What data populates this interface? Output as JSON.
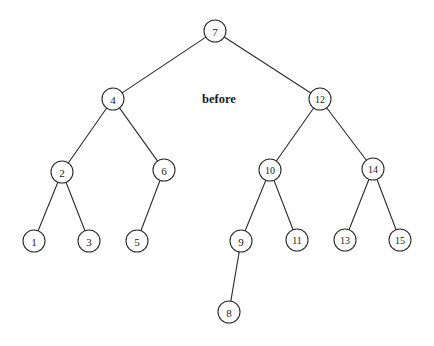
{
  "figure": {
    "caption": "before",
    "caption_x": 219,
    "caption_y": 99,
    "width": 434,
    "height": 346,
    "background_color": "#ffffff",
    "stroke_color": "#2b2b2b",
    "text_color": "#1a1a1a"
  },
  "chart_data": {
    "type": "diagram",
    "diagram_kind": "binary-search-tree",
    "title": "before",
    "node_radius": 11,
    "nodes": [
      {
        "id": "n7",
        "label": "7",
        "x": 215,
        "y": 31,
        "depth": 0
      },
      {
        "id": "n4",
        "label": "4",
        "x": 113,
        "y": 99,
        "depth": 1
      },
      {
        "id": "n12",
        "label": "12",
        "x": 320,
        "y": 99,
        "depth": 1
      },
      {
        "id": "n2",
        "label": "2",
        "x": 62,
        "y": 172,
        "depth": 2
      },
      {
        "id": "n6",
        "label": "6",
        "x": 164,
        "y": 170,
        "depth": 2
      },
      {
        "id": "n10",
        "label": "10",
        "x": 270,
        "y": 170,
        "depth": 2
      },
      {
        "id": "n14",
        "label": "14",
        "x": 373,
        "y": 169,
        "depth": 2
      },
      {
        "id": "n1",
        "label": "1",
        "x": 34,
        "y": 241,
        "depth": 3
      },
      {
        "id": "n3",
        "label": "3",
        "x": 89,
        "y": 241,
        "depth": 3
      },
      {
        "id": "n5",
        "label": "5",
        "x": 137,
        "y": 241,
        "depth": 3
      },
      {
        "id": "n9",
        "label": "9",
        "x": 241,
        "y": 241,
        "depth": 3
      },
      {
        "id": "n11",
        "label": "11",
        "x": 297,
        "y": 240,
        "depth": 3
      },
      {
        "id": "n13",
        "label": "13",
        "x": 345,
        "y": 240,
        "depth": 3
      },
      {
        "id": "n15",
        "label": "15",
        "x": 400,
        "y": 240,
        "depth": 3
      },
      {
        "id": "n8",
        "label": "8",
        "x": 229,
        "y": 312,
        "depth": 4
      }
    ],
    "edges": [
      {
        "from": "n7",
        "to": "n4",
        "side": "left"
      },
      {
        "from": "n7",
        "to": "n12",
        "side": "right"
      },
      {
        "from": "n4",
        "to": "n2",
        "side": "left"
      },
      {
        "from": "n4",
        "to": "n6",
        "side": "right"
      },
      {
        "from": "n12",
        "to": "n10",
        "side": "left"
      },
      {
        "from": "n12",
        "to": "n14",
        "side": "right"
      },
      {
        "from": "n2",
        "to": "n1",
        "side": "left"
      },
      {
        "from": "n2",
        "to": "n3",
        "side": "right"
      },
      {
        "from": "n6",
        "to": "n5",
        "side": "left"
      },
      {
        "from": "n10",
        "to": "n9",
        "side": "left"
      },
      {
        "from": "n10",
        "to": "n11",
        "side": "right"
      },
      {
        "from": "n14",
        "to": "n13",
        "side": "left"
      },
      {
        "from": "n14",
        "to": "n15",
        "side": "right"
      },
      {
        "from": "n9",
        "to": "n8",
        "side": "left"
      }
    ]
  }
}
